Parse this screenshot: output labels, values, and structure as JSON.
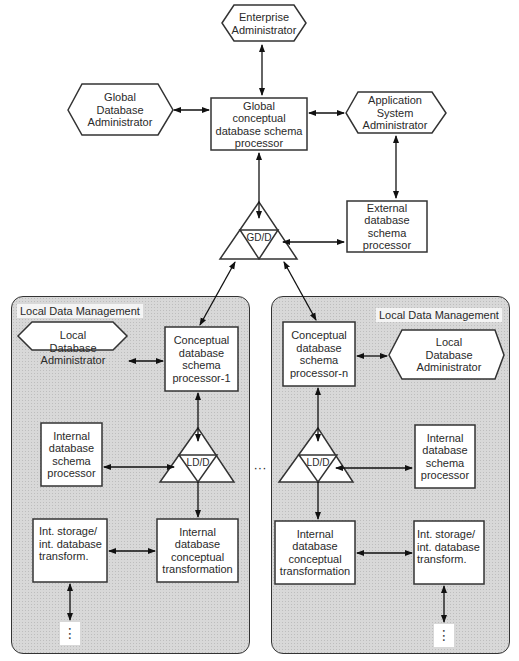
{
  "global": {
    "enterprise_admin": "Enterprise\nAdministrator",
    "global_db_admin": "Global\nDatabase\nAdministrator",
    "global_schema_processor": "Global\nconceptual\ndatabase schema\nprocessor",
    "app_system_admin": "Application\nSystem\nAdministrator",
    "external_schema_processor": "External\ndatabase schema\nprocessor",
    "gdd_label": "GD/D"
  },
  "local_left": {
    "title": "Local Data Management",
    "local_db_admin": "Local\nDatabase\nAdministrator",
    "conceptual_processor": "Conceptual\ndatabase\nschema\nprocessor-1",
    "internal_schema_processor": "Internal\ndatabase\nschema\nprocessor",
    "ldd_label": "LD/D",
    "int_storage": "Int. storage/\nint. database\ntransform.",
    "internal_conceptual_transform": "Internal\ndatabase\nconceptual\ntransformation",
    "continuation": "⋮"
  },
  "local_right": {
    "title": "Local Data Management",
    "local_db_admin": "Local\nDatabase\nAdministrator",
    "conceptual_processor": "Conceptual\ndatabase\nschema\nprocessor-n",
    "internal_schema_processor": "Internal\ndatabase\nschema\nprocessor",
    "ldd_label": "LD/D",
    "int_storage": "Int. storage/\nint. database\ntransform.",
    "internal_conceptual_transform": "Internal\ndatabase\nconceptual\ntransformation",
    "continuation": "⋮"
  },
  "between_regions": "···"
}
